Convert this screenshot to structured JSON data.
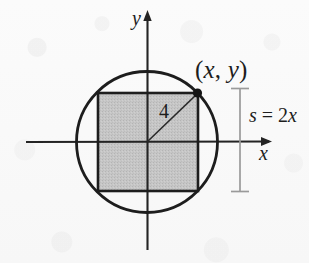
{
  "figure": {
    "background_color": "#fafafa",
    "stroke_color": "#1d1d1d",
    "fill_color": "#c3c3c3",
    "dimension_color": "#9a9a9a"
  },
  "axes": {
    "x_label": "x",
    "y_label": "y",
    "origin": {
      "x": 147,
      "y": 142
    }
  },
  "circle": {
    "center": {
      "x": 147,
      "y": 142
    },
    "radius": 71
  },
  "square": {
    "left": 98,
    "top": 93,
    "right": 198,
    "bottom": 191,
    "fill": "#c3c3c3"
  },
  "radius_segment": {
    "label": "4",
    "from": {
      "x": 147,
      "y": 142
    },
    "to": {
      "x": 198,
      "y": 93
    }
  },
  "point": {
    "label": "(x, y)",
    "label_parts": {
      "open": "(",
      "x": "x",
      "comma": ", ",
      "y": "y",
      "close": ")"
    },
    "at": {
      "x": 198,
      "y": 93
    }
  },
  "dimension": {
    "label": "s = 2x",
    "label_parts": {
      "s": "s",
      "equals": " = ",
      "two": "2",
      "x": "x"
    },
    "top": 88,
    "bottom": 192,
    "x": 240
  }
}
